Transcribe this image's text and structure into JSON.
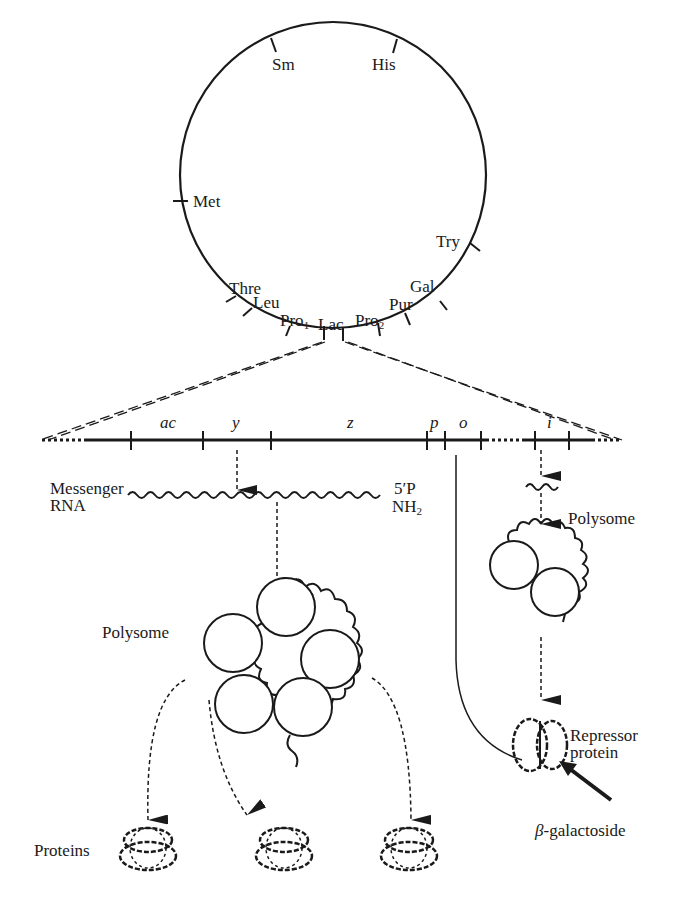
{
  "diagram": {
    "chromosome_markers": [
      {
        "label": "Sm"
      },
      {
        "label": "His"
      },
      {
        "label": "Met"
      },
      {
        "label": "Try"
      },
      {
        "label": "Thre"
      },
      {
        "label": "Leu"
      },
      {
        "label": "Pro",
        "subscript": "1"
      },
      {
        "label": "Lac"
      },
      {
        "label": "Pro",
        "subscript": "2"
      },
      {
        "label": "Pur"
      },
      {
        "label": "Gal"
      }
    ],
    "operon_genes": [
      "ac",
      "y",
      "z",
      "p",
      "o",
      "i"
    ],
    "messenger_rna": {
      "label_line1": "Messenger",
      "label_line2": "RNA",
      "end_5p": "5′P",
      "end_nh2": "NH",
      "end_nh2_sub": "2"
    },
    "polysome_left": {
      "label": "Polysome",
      "ribosome_count": 5
    },
    "polysome_right": {
      "label": "Polysome",
      "ribosome_count": 2
    },
    "repressor": {
      "label_line1": "Repressor",
      "label_line2": "protein"
    },
    "inducer": {
      "label_prefix": "β",
      "label": "-galactoside"
    },
    "proteins": {
      "label": "Proteins",
      "count": 3
    }
  }
}
